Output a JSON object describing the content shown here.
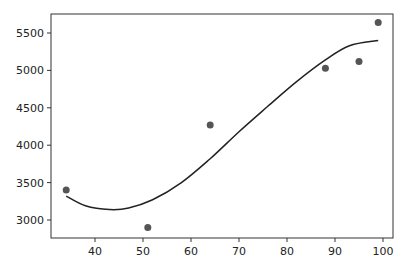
{
  "chart_data": {
    "type": "scatter",
    "title": "",
    "xlabel": "",
    "ylabel": "",
    "xlim": [
      30.5,
      102
    ],
    "ylim": [
      2775,
      5760
    ],
    "grid": false,
    "legend": null,
    "x_ticks": [
      40,
      50,
      60,
      70,
      80,
      90,
      100
    ],
    "y_ticks": [
      3000,
      3500,
      4000,
      4500,
      5000,
      5500
    ],
    "x_tick_labels": [
      "40",
      "50",
      "60",
      "70",
      "80",
      "90",
      "100"
    ],
    "y_tick_labels": [
      "3000",
      "3500",
      "4000",
      "4500",
      "5000",
      "5500"
    ],
    "series": [
      {
        "name": "data points",
        "type": "scatter",
        "color": "#555555",
        "x": [
          34,
          51,
          64,
          88,
          95,
          99
        ],
        "y": [
          3400,
          2900,
          4270,
          5030,
          5120,
          5640
        ]
      },
      {
        "name": "fitted curve",
        "type": "line",
        "color": "#222222",
        "x": [
          34,
          38,
          43,
          47,
          52,
          58,
          64,
          70,
          76,
          82,
          88,
          93,
          99
        ],
        "y": [
          3320,
          3190,
          3140,
          3160,
          3270,
          3500,
          3820,
          4180,
          4520,
          4850,
          5140,
          5330,
          5400
        ]
      }
    ]
  }
}
